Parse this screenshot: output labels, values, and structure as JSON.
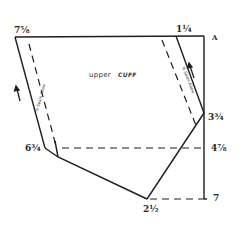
{
  "diagram": {
    "title": "upper CUFF",
    "title_parts": {
      "word1": "upper",
      "word2": "CUFF"
    },
    "measurements": {
      "top_left": "7⅝",
      "top_right": "1¼",
      "corner": "A",
      "right_upper": "3¾",
      "right_mid": "4⅞",
      "left_lower": "6¾",
      "bottom": "2½",
      "right_bottom": "7"
    },
    "seam_labels": {
      "left": "⅜ Seam Allow.",
      "right": "⅜ Seam Allow."
    },
    "colors": {
      "line": "#1e1e1e",
      "background": "#ffffff"
    }
  }
}
